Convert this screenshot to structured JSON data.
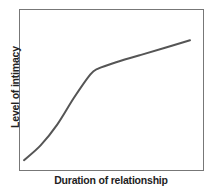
{
  "chart_data": {
    "type": "line",
    "title": "",
    "xlabel": "Duration of relationship",
    "ylabel": "Level of intimacy",
    "grid": false,
    "legend": null,
    "x_ticks": [],
    "y_ticks": [],
    "xlim": [
      0,
      100
    ],
    "ylim": [
      0,
      100
    ],
    "series": [
      {
        "name": "Intimacy over time",
        "color": "#555555",
        "x": [
          0,
          10,
          20,
          30,
          40,
          45,
          55,
          70,
          85,
          100
        ],
        "y": [
          8,
          18,
          32,
          50,
          66,
          70,
          74,
          79,
          84,
          89
        ]
      }
    ]
  },
  "labels": {
    "x_axis": "Duration of relationship",
    "y_axis": "Level of intimacy"
  },
  "colors": {
    "frame": "#777777",
    "curve": "#555555",
    "text": "#222222"
  }
}
